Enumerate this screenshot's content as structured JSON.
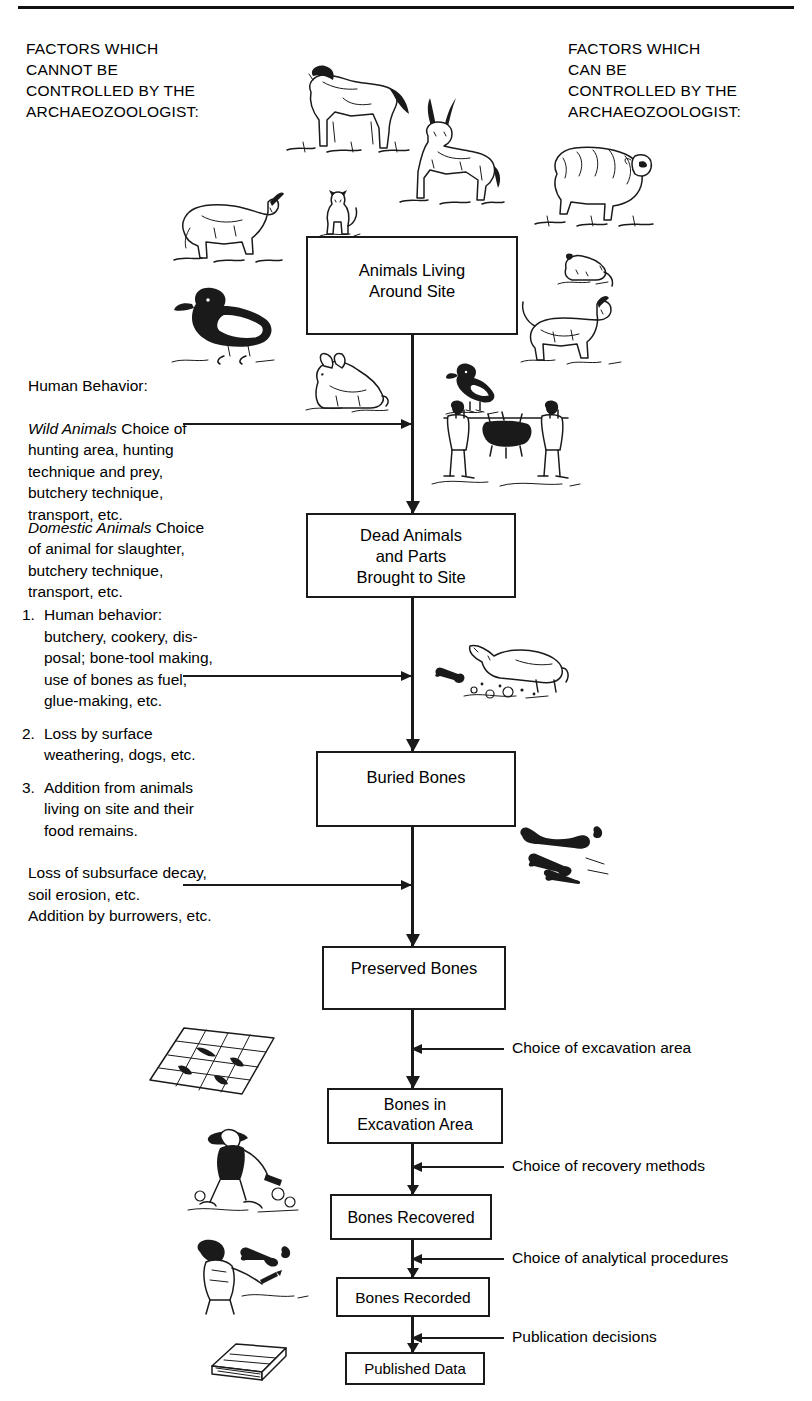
{
  "diagram": {
    "title_left": "FACTORS WHICH\nCANNOT BE\nCONTROLLED BY THE\nARCHAEOZOOLOGIST:",
    "title_right": "FACTORS WHICH\nCAN BE\nCONTROLLED BY THE\nARCHAEOZOOLOGIST:",
    "accent_color": "#1a1a1a",
    "background_color": "#ffffff"
  },
  "boxes": [
    {
      "id": "animals",
      "label": "Animals Living\nAround Site"
    },
    {
      "id": "dead",
      "label": "Dead Animals\nand Parts\nBrought to Site"
    },
    {
      "id": "buried",
      "label": "Buried Bones"
    },
    {
      "id": "preserved",
      "label": "Preserved Bones"
    },
    {
      "id": "excavation",
      "label": "Bones in\nExcavation Area"
    },
    {
      "id": "recovered",
      "label": "Bones Recovered"
    },
    {
      "id": "recorded",
      "label": "Bones Recorded"
    },
    {
      "id": "published",
      "label": "Published Data"
    }
  ],
  "left_factors": {
    "human_behavior": {
      "heading": "Human Behavior:",
      "wild_label": "Wild Animals",
      "wild_text": " Choice of\nhunting area, hunting\ntechnique and prey,\nbutchery technique,\ntransport, etc.",
      "domestic_label": "Domestic Animals",
      "domestic_text": " Choice\nof animal for slaughter,\nbutchery technique,\ntransport, etc."
    },
    "numbered": [
      {
        "num": "1.",
        "text": "Human behavior:\nbutchery, cookery, dis-\nposal; bone-tool making,\nuse of bones as fuel,\nglue-making, etc."
      },
      {
        "num": "2.",
        "text": "Loss by surface\nweathering, dogs, etc."
      },
      {
        "num": "3.",
        "text": "Addition from animals\nliving on site and their\nfood remains."
      }
    ],
    "loss_block": "Loss of subsurface decay,\nsoil erosion, etc.\nAddition by burrowers, etc."
  },
  "right_factors": [
    {
      "id": "excavation-area",
      "label": "Choice of excavation area"
    },
    {
      "id": "recovery-methods",
      "label": "Choice of recovery methods"
    },
    {
      "id": "analytical-procedures",
      "label": "Choice of analytical procedures"
    },
    {
      "id": "publication-decisions",
      "label": "Publication decisions"
    }
  ],
  "illustrations": [
    {
      "id": "horse",
      "name": "horse-illustration"
    },
    {
      "id": "antelope",
      "name": "antelope-illustration"
    },
    {
      "id": "sheep",
      "name": "sheep-illustration"
    },
    {
      "id": "goat",
      "name": "goat-illustration"
    },
    {
      "id": "cat",
      "name": "cat-illustration"
    },
    {
      "id": "rodent",
      "name": "rodent-illustration"
    },
    {
      "id": "dog",
      "name": "dog-illustration"
    },
    {
      "id": "duck",
      "name": "duck-illustration"
    },
    {
      "id": "rabbit",
      "name": "rabbit-illustration"
    },
    {
      "id": "bird",
      "name": "small-bird-illustration"
    },
    {
      "id": "hunters",
      "name": "hunters-carrying-carcass-illustration"
    },
    {
      "id": "dog-digging",
      "name": "dog-digging-bone-illustration"
    },
    {
      "id": "buried-bones",
      "name": "buried-bones-illustration"
    },
    {
      "id": "excavation-grid",
      "name": "excavation-grid-illustration"
    },
    {
      "id": "excavator",
      "name": "excavator-digging-illustration"
    },
    {
      "id": "lab-worker",
      "name": "lab-recording-bones-illustration"
    },
    {
      "id": "book",
      "name": "publication-book-illustration"
    }
  ]
}
